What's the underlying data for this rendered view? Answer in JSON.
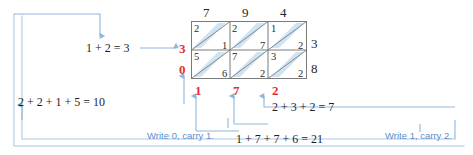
{
  "diagram": {
    "type": "lattice-multiplication",
    "title": "",
    "colors": {
      "red_digit": "#e03030",
      "connector_blue": "#8fb6dd",
      "note_blue": "#5b8fc9",
      "cell_shade": "#cfe3f3",
      "grid_line": "#7a7a7a"
    }
  },
  "lattice": {
    "top_digits": [
      "7",
      "9",
      "4"
    ],
    "right_digits": [
      "3",
      "8"
    ],
    "left_digits": [
      "3",
      "0"
    ],
    "bottom_digits": [
      "1",
      "7",
      "2"
    ],
    "cells": [
      [
        {
          "upper": "2",
          "lower": "1"
        },
        {
          "upper": "2",
          "lower": "7"
        },
        {
          "upper": "1",
          "lower": "2"
        }
      ],
      [
        {
          "upper": "5",
          "lower": "6"
        },
        {
          "upper": "7",
          "lower": "2"
        },
        {
          "upper": "3",
          "lower": "2"
        }
      ]
    ]
  },
  "annotations": {
    "eq_upper_left": "1 + 2 = 3",
    "eq_lower_left": "2 + 2 + 1 + 5 = 10",
    "eq_mid_right": "2 + 3 + 2 = 7",
    "eq_bottom_center": "1 + 7 + 7 + 6 = 21",
    "note_write_zero": "Write 0, carry 1.",
    "note_write_one": "Write 1, carry 2."
  }
}
